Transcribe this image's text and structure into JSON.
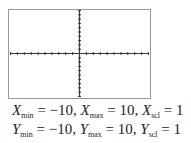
{
  "chart_data": {
    "type": "graph-window",
    "title": "",
    "x_axis": {
      "min": -10,
      "max": 10,
      "scale": 1
    },
    "y_axis": {
      "min": -10,
      "max": 10,
      "scale": 1
    },
    "grid": false,
    "series": []
  },
  "window": {
    "line1": {
      "x_min_label": "X",
      "x_min_sub": "min",
      "x_min_value": "= −10,",
      "x_max_label": "X",
      "x_max_sub": "max",
      "x_max_value": "= 10,",
      "x_scl_label": "X",
      "x_scl_sub": "scl",
      "x_scl_value": "= 1"
    },
    "line2": {
      "y_min_label": "Y",
      "y_min_sub": "min",
      "y_min_value": "= −10,",
      "y_max_label": "Y",
      "y_max_sub": "max",
      "y_max_value": "= 10,",
      "y_scl_label": "Y",
      "y_scl_sub": "scl",
      "y_scl_value": "= 1"
    }
  },
  "colors": {
    "frame": "#9a9a9a",
    "axis": "#3a3a3a",
    "text": "#222222"
  }
}
